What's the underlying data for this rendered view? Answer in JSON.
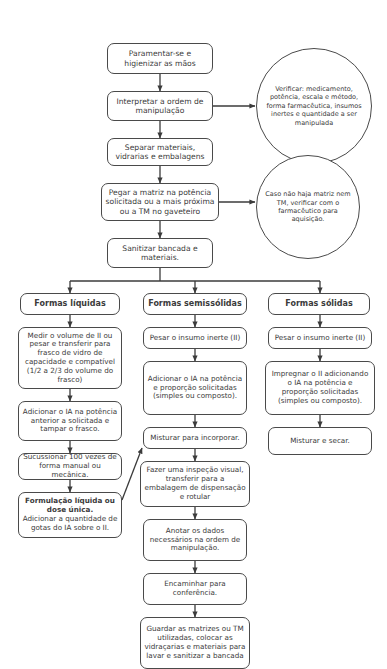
{
  "diagram": {
    "colors": {
      "background": "#ffffff",
      "border": "#4a4a4a",
      "text": "#3b3b3b",
      "edge": "#3b3b3b"
    },
    "main_flow": [
      {
        "id": "n1",
        "text": "Paramentar-se e higienizar as mãos"
      },
      {
        "id": "n2",
        "text": "Interpretar a ordem de manipulação"
      },
      {
        "id": "n3",
        "text": "Separar materiais, vidrarias e embalagens"
      },
      {
        "id": "n4",
        "text": "Pegar a matriz na potência solicitada ou a mais próxima ou a TM no gaveteiro"
      },
      {
        "id": "n5",
        "text": "Sanitizar bancada e materiais."
      }
    ],
    "notes": [
      {
        "id": "c1",
        "text": "Verificar: medicamento, potência, escala e método, forma farmacêutica, insumos inertes e quantidade a ser manipulada"
      },
      {
        "id": "c2",
        "text": "Caso não haja matriz nem TM, verificar com o farmacêutico para aquisição."
      }
    ],
    "columns": [
      {
        "id": "col-liquidas",
        "header": "Formas líquidas",
        "steps": [
          {
            "id": "l1",
            "text": "Medir o volume de II ou pesar e transferir para frasco de vidro de capacidade e compatível (1/2 a 2/3 do volume do frasco)"
          },
          {
            "id": "l2",
            "text": "Adicionar o IA na potência anterior a solicitada e tampar o frasco."
          },
          {
            "id": "l3",
            "text": "Sucussionar 100 vezes de forma manual ou mecânica."
          },
          {
            "id": "l4",
            "bold_prefix": "Formulação líquida ou dose única.",
            "text": " Adicionar a quantidade de gotas do IA sobre o II."
          }
        ]
      },
      {
        "id": "col-semissolidas",
        "header": "Formas semissólidas",
        "steps": [
          {
            "id": "m1",
            "text": "Pesar o insumo inerte (II)"
          },
          {
            "id": "m2",
            "text": "Adicionar o IA na potência e proporção solicitadas (simples ou composto)."
          },
          {
            "id": "m3",
            "text": "Misturar para incorporar."
          },
          {
            "id": "m4",
            "text": "Fazer uma inspeção visual, transferir para a embalagem de dispensação e rotular"
          },
          {
            "id": "m5",
            "text": "Anotar os dados necessários na ordem de manipulação."
          },
          {
            "id": "m6",
            "text": "Encaminhar para conferência."
          },
          {
            "id": "m7",
            "text": "Guardar as matrizes ou TM utilizadas, colocar as vidraçarias e materiais para lavar e sanitizar a bancada"
          }
        ]
      },
      {
        "id": "col-solidas",
        "header": "Formas sólidas",
        "steps": [
          {
            "id": "r1",
            "text": "Pesar o insumo inerte (II)"
          },
          {
            "id": "r2",
            "text": "Impregnar o II adicionando o IA na potência e proporção solicitadas (simples ou composto)."
          },
          {
            "id": "r3",
            "text": "Misturar e secar."
          }
        ]
      }
    ]
  }
}
